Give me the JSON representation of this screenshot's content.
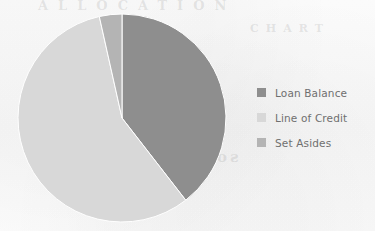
{
  "chart_data": {
    "type": "pie",
    "title": "",
    "categories": [
      "Loan Balance",
      "Line of Credit",
      "Set Asides"
    ],
    "values": [
      39.5,
      57.0,
      3.5
    ],
    "value_unit": "percent",
    "colors": [
      "#8e8e8e",
      "#d8d8d8",
      "#b4b4b4"
    ],
    "start_angle_deg": 0,
    "direction": "clockwise",
    "slice_angles_deg": [
      142.2,
      205.2,
      12.6
    ],
    "legend": {
      "position": "right",
      "entries": [
        {
          "label": "Loan Balance",
          "color": "#8e8e8e"
        },
        {
          "label": "Line of Credit",
          "color": "#d8d8d8"
        },
        {
          "label": "Set Asides",
          "color": "#b4b4b4"
        }
      ]
    },
    "grid": false,
    "xlabel": "",
    "ylabel": ""
  },
  "pie": {
    "center_x": 105,
    "center_y": 105,
    "radius": 104,
    "separator_color": "#ffffff"
  },
  "background": {
    "page_color": "#fbfbfb",
    "bleed_through_top": "ALLOCATION",
    "bleed_through_middle": "sources of funds",
    "bleed_through_right": "CHART"
  }
}
